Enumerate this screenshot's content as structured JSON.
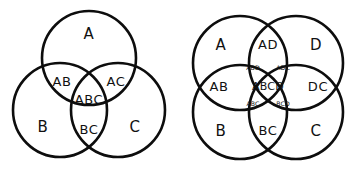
{
  "page": {
    "background_color": "#ffffff",
    "stroke_color": "#0d0d0d",
    "text_color": "#111111",
    "width": 357,
    "height": 174
  },
  "diagrams": [
    {
      "name": "three-set-venn",
      "set_count": 3,
      "sets": [
        "A",
        "B",
        "C"
      ],
      "circles": [
        {
          "id": "A",
          "cx": 89,
          "cy": 58,
          "r": 47
        },
        {
          "id": "B",
          "cx": 60,
          "cy": 110,
          "r": 47
        },
        {
          "id": "C",
          "cx": 118,
          "cy": 110,
          "r": 47
        }
      ],
      "regions": [
        {
          "key": "A",
          "label": "A",
          "x": 89,
          "y": 34,
          "size": "major"
        },
        {
          "key": "B",
          "label": "B",
          "x": 43,
          "y": 127,
          "size": "major"
        },
        {
          "key": "C",
          "label": "C",
          "x": 135,
          "y": 127,
          "size": "major"
        },
        {
          "key": "AB",
          "label": "AB",
          "x": 62,
          "y": 82,
          "size": "mid"
        },
        {
          "key": "AC",
          "label": "AC",
          "x": 116,
          "y": 82,
          "size": "mid"
        },
        {
          "key": "ABC",
          "label": "ABC",
          "x": 89,
          "y": 100,
          "size": "mid"
        },
        {
          "key": "BC",
          "label": "BC",
          "x": 89,
          "y": 130,
          "size": "mid"
        }
      ]
    },
    {
      "name": "four-set-venn",
      "set_count": 4,
      "sets": [
        "A",
        "B",
        "C",
        "D"
      ],
      "circles": [
        {
          "id": "A",
          "cx": 240,
          "cy": 63,
          "r": 47
        },
        {
          "id": "D",
          "cx": 296,
          "cy": 63,
          "r": 47
        },
        {
          "id": "B",
          "cx": 240,
          "cy": 112,
          "r": 47
        },
        {
          "id": "C",
          "cx": 296,
          "cy": 112,
          "r": 47
        }
      ],
      "regions": [
        {
          "key": "A",
          "label": "A",
          "x": 221,
          "y": 45,
          "size": "major"
        },
        {
          "key": "D",
          "label": "D",
          "x": 316,
          "y": 45,
          "size": "major"
        },
        {
          "key": "B",
          "label": "B",
          "x": 221,
          "y": 131,
          "size": "major"
        },
        {
          "key": "C",
          "label": "C",
          "x": 316,
          "y": 131,
          "size": "major"
        },
        {
          "key": "AD",
          "label": "AD",
          "x": 268,
          "y": 45,
          "size": "mid"
        },
        {
          "key": "AB",
          "label": "AB",
          "x": 219,
          "y": 87,
          "size": "mid"
        },
        {
          "key": "DC",
          "label": "DC",
          "x": 318,
          "y": 87,
          "size": "mid"
        },
        {
          "key": "BC",
          "label": "BC",
          "x": 268,
          "y": 131,
          "size": "mid"
        },
        {
          "key": "ABD",
          "label": "ABD",
          "x": 253,
          "y": 68,
          "size": "small"
        },
        {
          "key": "ADC",
          "label": "ADC",
          "x": 283,
          "y": 68,
          "size": "small"
        },
        {
          "key": "ABC",
          "label": "ABC",
          "x": 253,
          "y": 104,
          "size": "small"
        },
        {
          "key": "BCD",
          "label": "BCD",
          "x": 283,
          "y": 104,
          "size": "small"
        },
        {
          "key": "ABCD",
          "label": "ABCD",
          "x": 268,
          "y": 87,
          "size": "center4"
        }
      ]
    }
  ]
}
